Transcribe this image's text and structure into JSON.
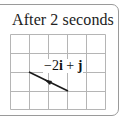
{
  "panel": {
    "title": "After 2 seconds",
    "vector_label": {
      "coef_i": "−2",
      "unit_i": "i",
      "plus": " + ",
      "unit_j": "j"
    }
  },
  "grid": {
    "columns": 5,
    "rows": 4,
    "line_color": "#b5b5b5",
    "x_lines": [
      10,
      29,
      48,
      67,
      86,
      105
    ],
    "y_lines": [
      34,
      53,
      72,
      91,
      109
    ]
  },
  "vector": {
    "from": [
      68,
      91
    ],
    "to": [
      29,
      72
    ],
    "color": "#1a1a1a",
    "components": {
      "i": -2,
      "j": 1
    }
  }
}
